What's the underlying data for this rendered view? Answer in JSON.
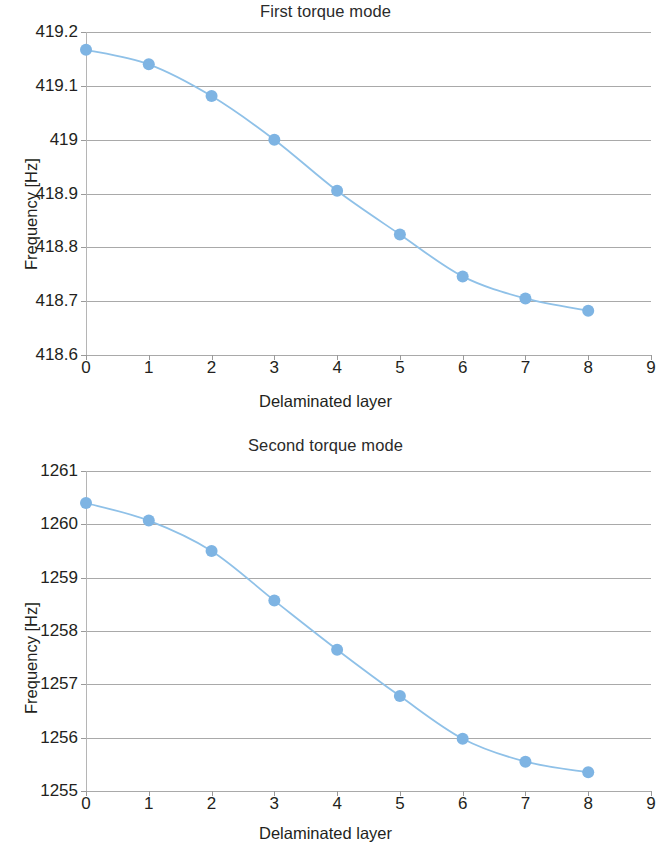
{
  "figures": [
    {
      "id": "figure-1",
      "title": "First torque mode",
      "ylabel": "Frequency [Hz]",
      "xlabel": "Delaminated layer"
    },
    {
      "id": "figure-2",
      "title": "Second torque mode",
      "ylabel": "Frequency [Hz]",
      "xlabel": "Delaminated layer"
    }
  ],
  "style": {
    "marker_color": "#7EB4E3",
    "line_color": "#8FC1E8",
    "grid_color": "#9A9A9A",
    "text_color": "#231F20"
  },
  "chart_data": [
    {
      "type": "line",
      "title": "First torque mode",
      "xlabel": "Delaminated layer",
      "ylabel": "Frequency [Hz]",
      "x": [
        0,
        1,
        2,
        3,
        4,
        5,
        6,
        7,
        8
      ],
      "values": [
        419.167,
        419.14,
        419.081,
        419.0,
        418.905,
        418.824,
        418.746,
        418.705,
        418.682
      ],
      "xlim": [
        0,
        9
      ],
      "ylim": [
        418.6,
        419.2
      ],
      "xticks": [
        "0",
        "1",
        "2",
        "3",
        "4",
        "5",
        "6",
        "7",
        "8",
        "9"
      ],
      "yticks": [
        "419.2",
        "419.1",
        "419",
        "418.9",
        "418.8",
        "418.7",
        "418.6"
      ],
      "ytick_values": [
        419.2,
        419.1,
        419.0,
        418.9,
        418.8,
        418.7,
        418.6
      ],
      "grid": true,
      "legend": null,
      "marker": "circle",
      "series_name": "First torque mode frequency"
    },
    {
      "type": "line",
      "title": "Second torque mode",
      "xlabel": "Delaminated layer",
      "ylabel": "Frequency [Hz]",
      "x": [
        0,
        1,
        2,
        3,
        4,
        5,
        6,
        7,
        8
      ],
      "values": [
        1260.4,
        1260.07,
        1259.5,
        1258.57,
        1257.65,
        1256.78,
        1255.98,
        1255.55,
        1255.35
      ],
      "xlim": [
        0,
        9
      ],
      "ylim": [
        1255,
        1261
      ],
      "xticks": [
        "0",
        "1",
        "2",
        "3",
        "4",
        "5",
        "6",
        "7",
        "8",
        "9"
      ],
      "yticks": [
        "1261",
        "1260",
        "1259",
        "1258",
        "1257",
        "1256",
        "1255"
      ],
      "ytick_values": [
        1261,
        1260,
        1259,
        1258,
        1257,
        1256,
        1255
      ],
      "grid": true,
      "legend": null,
      "marker": "circle",
      "series_name": "Second torque mode frequency"
    }
  ]
}
